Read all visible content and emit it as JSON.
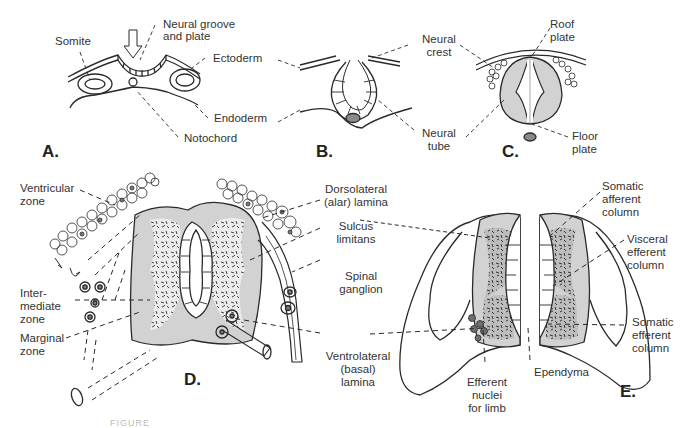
{
  "figure": {
    "caption_fragment": "FIGURE",
    "colors": {
      "line": "#2a2a2a",
      "gray_fill": "#d2d2d2",
      "dark_cell": "#7a7a7a",
      "background": "#ffffff"
    }
  },
  "panels": {
    "A": {
      "label": "A.",
      "annotations": {
        "somite": "Somite",
        "neural_groove_1": "Neural groove",
        "neural_groove_2": "and plate",
        "ectoderm": "Ectoderm",
        "endoderm": "Endoderm",
        "notochord": "Notochord"
      }
    },
    "B": {
      "label": "B.",
      "annotations": {
        "neural_crest_1": "Neural",
        "neural_crest_2": "crest",
        "neural_tube_1": "Neural",
        "neural_tube_2": "tube"
      }
    },
    "C": {
      "label": "C.",
      "annotations": {
        "roof_plate_1": "Roof",
        "roof_plate_2": "plate",
        "floor_plate_1": "Floor",
        "floor_plate_2": "plate"
      }
    },
    "D": {
      "label": "D.",
      "annotations": {
        "ventricular_1": "Ventricular",
        "ventricular_2": "zone",
        "intermediate_1": "Inter-",
        "intermediate_2": "mediate",
        "intermediate_3": "zone",
        "marginal_1": "Marginal",
        "marginal_2": "zone",
        "dorsolateral_1": "Dorsolateral",
        "dorsolateral_2": "(alar) lamina",
        "sulcus_1": "Sulcus",
        "sulcus_2": "limitans",
        "spinal_1": "Spinal",
        "spinal_2": "ganglion",
        "ventrolateral_1": "Ventrolateral",
        "ventrolateral_2": "(basal)",
        "ventrolateral_3": "lamina"
      }
    },
    "E": {
      "label": "E.",
      "annotations": {
        "somatic_aff_1": "Somatic",
        "somatic_aff_2": "afferent",
        "somatic_aff_3": "column",
        "visceral_1": "Visceral",
        "visceral_2": "efferent",
        "visceral_3": "column",
        "somatic_eff_1": "Somatic",
        "somatic_eff_2": "efferent",
        "somatic_eff_3": "column",
        "ependyma": "Ependyma",
        "efferent_nuclei_1": "Efferent",
        "efferent_nuclei_2": "nuclei",
        "efferent_nuclei_3": "for limb"
      }
    }
  }
}
